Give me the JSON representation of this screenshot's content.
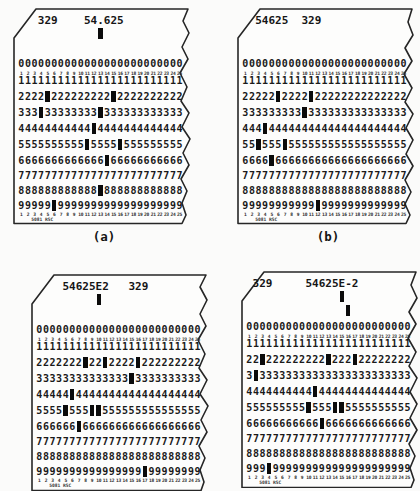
{
  "figure": {
    "captions": {
      "a": "(a)",
      "b": "(b)"
    },
    "card_form_label": "5081 RSC",
    "columns": 25,
    "column_numbers": [
      "1",
      "2",
      "3",
      "4",
      "5",
      "6",
      "7",
      "8",
      "9",
      "10",
      "11",
      "12",
      "13",
      "14",
      "15",
      "16",
      "17",
      "18",
      "19",
      "20",
      "21",
      "22",
      "23",
      "24",
      "25"
    ],
    "row_digits": [
      "0",
      "1",
      "2",
      "3",
      "4",
      "5",
      "6",
      "7",
      "8",
      "9"
    ],
    "cards": [
      {
        "id": "a",
        "header": [
          {
            "text": "329",
            "start_col": 4
          },
          {
            "text": "54.625",
            "start_col": 11
          }
        ],
        "zone12_punch_cols": [
          13
        ],
        "zone11_punch_cols": [],
        "row_punch_cols": {
          "0": [],
          "1": [],
          "2": [
            5,
            15
          ],
          "3": [
            4,
            13
          ],
          "4": [
            12
          ],
          "5": [
            11,
            16
          ],
          "6": [
            14
          ],
          "7": [],
          "8": [
            13
          ],
          "9": [
            6
          ]
        }
      },
      {
        "id": "b",
        "header": [
          {
            "text": "54625",
            "start_col": 3
          },
          {
            "text": "329",
            "start_col": 10
          }
        ],
        "zone12_punch_cols": [],
        "zone11_punch_cols": [],
        "row_punch_cols": {
          "0": [],
          "1": [],
          "2": [
            6,
            11
          ],
          "3": [
            10
          ],
          "4": [
            4
          ],
          "5": [
            3,
            7
          ],
          "6": [
            5
          ],
          "7": [],
          "8": [],
          "9": [
            12
          ]
        }
      },
      {
        "id": "c",
        "header": [
          {
            "text": "54625E2",
            "start_col": 5
          },
          {
            "text": "329",
            "start_col": 15
          }
        ],
        "zone12_punch_cols": [
          10
        ],
        "zone11_punch_cols": [],
        "row_punch_cols": {
          "0": [],
          "1": [],
          "2": [
            8,
            11,
            16
          ],
          "3": [
            15
          ],
          "4": [
            6
          ],
          "5": [
            5,
            9,
            10
          ],
          "6": [
            7
          ],
          "7": [],
          "8": [],
          "9": [
            17
          ]
        }
      },
      {
        "id": "d",
        "header": [
          {
            "text": "329",
            "start_col": 2
          },
          {
            "text": "54625E-2",
            "start_col": 10
          }
        ],
        "zone12_punch_cols": [
          15
        ],
        "zone11_punch_cols": [
          16
        ],
        "row_punch_cols": {
          "0": [],
          "1": [],
          "2": [
            3,
            13,
            17
          ],
          "3": [
            2
          ],
          "4": [
            11
          ],
          "5": [
            10,
            14,
            15
          ],
          "6": [
            12
          ],
          "7": [],
          "8": [],
          "9": [
            4
          ]
        }
      }
    ]
  }
}
